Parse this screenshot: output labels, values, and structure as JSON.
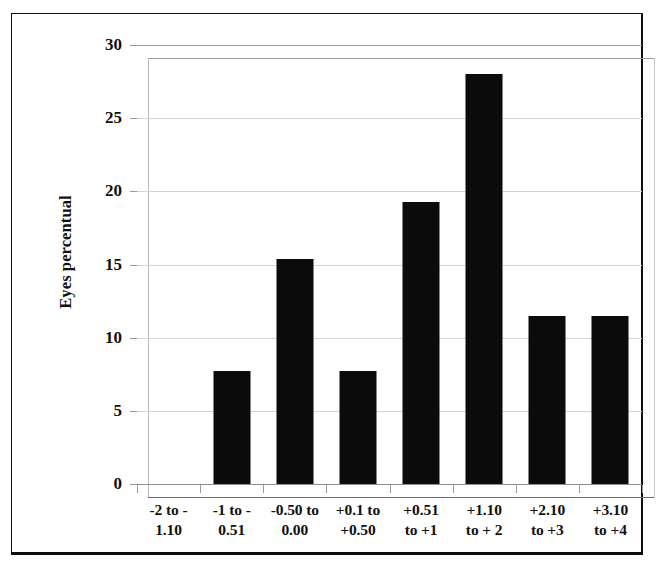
{
  "chart_data": {
    "type": "bar",
    "title": "",
    "xlabel": "",
    "ylabel": "Eyes percentual",
    "categories": [
      "-2 to -1.10",
      "-1 to -0.51",
      "-0.50 to 0.00",
      "+0.1 to +0.50",
      "+0.51 to +1",
      "+1.10 to + 2",
      "+2.10 to +3",
      "+3.10 to +4"
    ],
    "category_lines": [
      [
        "-2 to -",
        "1.10"
      ],
      [
        "-1 to -",
        "0.51"
      ],
      [
        "-0.50 to",
        "0.00"
      ],
      [
        "+0.1 to",
        "+0.50"
      ],
      [
        "+0.51",
        "to +1"
      ],
      [
        "+1.10",
        "to + 2"
      ],
      [
        "+2.10",
        "to +3"
      ],
      [
        "+3.10",
        "to +4"
      ]
    ],
    "values": [
      0,
      7.7,
      15.4,
      7.7,
      19.3,
      28,
      11.5,
      11.5
    ],
    "ylim": [
      0,
      30
    ],
    "yticks": [
      0,
      5,
      10,
      15,
      20,
      25,
      30
    ],
    "ytick_labels": [
      "0",
      "5",
      "10",
      "15",
      "20",
      "25",
      "30"
    ],
    "grid": true,
    "legend": "none",
    "bar_color": "#0b0b0b",
    "grid_color": "#d4d4d4",
    "background_color": "#ffffff",
    "frame_color": "#0e0e0e"
  }
}
